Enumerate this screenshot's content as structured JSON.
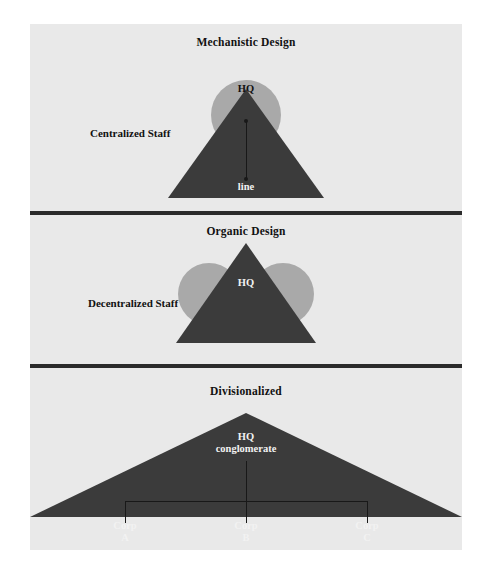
{
  "figure": {
    "background_color": "#e9e9e9",
    "page_background_color": "#ffffff",
    "triangle_color": "#3b3b3b",
    "circle_color": "#a9a9a9",
    "divider_color": "#2b2b2b"
  },
  "panels": {
    "mechanistic": {
      "title": "Mechanistic Design",
      "staff_label": "Centralized Staff",
      "hq_label": "HQ",
      "line_label": "line"
    },
    "organic": {
      "title": "Organic Design",
      "staff_label": "Decentralized Staff",
      "hq_label": "HQ"
    },
    "divisionalized": {
      "title": "Divisionalized",
      "hq_label": "HQ\nconglomerate",
      "divisions": [
        {
          "label": "Corp\nA"
        },
        {
          "label": "Corp\nB"
        },
        {
          "label": "Corp\nC"
        }
      ]
    }
  }
}
